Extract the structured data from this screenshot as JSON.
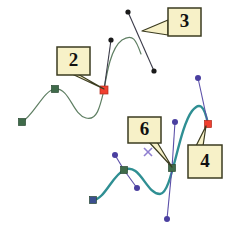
{
  "figure": {
    "background_color": "#ffffff",
    "width": 239,
    "height": 234
  },
  "colors": {
    "curve_green": "#5f7f63",
    "curve_teal": "#2f8f93",
    "handle_dark": "#3a3a48",
    "handle_purple": "#5b4fa8",
    "node_green": "#3f6b4a",
    "node_red": "#f04030",
    "node_blue": "#3b4f8f",
    "node_purple": "#4a3fa0",
    "callout_fill": "#f7f1c8",
    "callout_border": "#3b3b20",
    "cursor_purple": "#8f7fd0"
  },
  "callouts": [
    {
      "id": "callout-2",
      "label": "2",
      "x": 57,
      "y": 47,
      "w": 33,
      "h": 28,
      "tail": [
        [
          76,
          73
        ],
        [
          104,
          89
        ],
        [
          72,
          74
        ]
      ]
    },
    {
      "id": "callout-3",
      "label": "3",
      "x": 168,
      "y": 8,
      "w": 33,
      "h": 28,
      "tail": [
        [
          168,
          20
        ],
        [
          142,
          31
        ],
        [
          168,
          35
        ]
      ]
    },
    {
      "id": "callout-6",
      "label": "6",
      "x": 128,
      "y": 117,
      "w": 33,
      "h": 26,
      "tail": [
        [
          148,
          141
        ],
        [
          172,
          167
        ],
        [
          157,
          142
        ]
      ]
    },
    {
      "id": "callout-4",
      "label": "4",
      "x": 188,
      "y": 145,
      "w": 34,
      "h": 33,
      "tail": [
        [
          196,
          146
        ],
        [
          206,
          126
        ],
        [
          203,
          146
        ]
      ]
    }
  ],
  "curves": [
    {
      "id": "green-curve",
      "stroke": "#5f7f63",
      "stroke_width": 1.2,
      "path": "M 22 122 C 34 115 44 90 55 89 C 70 88 72 114 86 118 C 97 121 100 107 104 90"
    },
    {
      "id": "green-curve-upper",
      "stroke": "#5f7f63",
      "stroke_width": 1.2,
      "path": "M 104 90 C 107 72 111 48 122 40 C 133 33 136 40 141 54"
    },
    {
      "id": "teal-curve",
      "stroke": "#2f8f93",
      "stroke_width": 2.4,
      "path": "M 93 200 C 104 200 112 176 124 170 C 140 162 146 194 160 194 C 172 194 178 130 192 111 C 199 102 204 104 208 124"
    }
  ],
  "handles": [
    {
      "id": "handle-green-left",
      "stroke": "#3a3a48",
      "x1": 104,
      "y1": 90,
      "x2": 111,
      "y2": 40
    },
    {
      "id": "handle-green-right",
      "stroke": "#3a3a48",
      "x1": 128,
      "y1": 12,
      "x2": 154,
      "y2": 71
    },
    {
      "id": "handle-teal-top",
      "stroke": "#5b4fa8",
      "x1": 198,
      "y1": 78,
      "x2": 208,
      "y2": 124
    },
    {
      "id": "handle-teal-upper",
      "stroke": "#5b4fa8",
      "x1": 175,
      "y1": 122,
      "x2": 172,
      "y2": 168
    },
    {
      "id": "handle-teal-lower",
      "stroke": "#5b4fa8",
      "x1": 172,
      "y1": 168,
      "x2": 167,
      "y2": 219
    },
    {
      "id": "handle-teal-node-a",
      "stroke": "#5b4fa8",
      "x1": 115,
      "y1": 155,
      "x2": 124,
      "y2": 170
    },
    {
      "id": "handle-teal-node-b",
      "stroke": "#5b4fa8",
      "x1": 124,
      "y1": 170,
      "x2": 137,
      "y2": 188
    }
  ],
  "nodes": [
    {
      "id": "node-green-end",
      "shape": "square",
      "fill": "#3f6b4a",
      "x": 22,
      "y": 122,
      "size": 7
    },
    {
      "id": "node-green-mid",
      "shape": "square",
      "fill": "#3f6b4a",
      "x": 55,
      "y": 89,
      "size": 7
    },
    {
      "id": "node-green-active",
      "shape": "square",
      "fill": "#f04030",
      "x": 104,
      "y": 90,
      "size": 8
    },
    {
      "id": "node-teal-start",
      "shape": "square",
      "fill": "#3b4f8f",
      "x": 93,
      "y": 200,
      "size": 7
    },
    {
      "id": "node-teal-mid",
      "shape": "square",
      "fill": "#3f6b4a",
      "x": 124,
      "y": 170,
      "size": 7
    },
    {
      "id": "node-teal-sel",
      "shape": "square",
      "fill": "#3f6b4a",
      "x": 172,
      "y": 168,
      "size": 7
    },
    {
      "id": "node-teal-end",
      "shape": "square",
      "fill": "#f04030",
      "x": 208,
      "y": 124,
      "size": 7
    }
  ],
  "control_points": [
    {
      "id": "cp-green-upper-left",
      "fill": "#1a1a1a",
      "x": 111,
      "y": 40,
      "r": 2.6
    },
    {
      "id": "cp-green-upper-right",
      "fill": "#1a1a1a",
      "x": 128,
      "y": 12,
      "r": 2.6
    },
    {
      "id": "cp-green-lower-right",
      "fill": "#1a1a1a",
      "x": 154,
      "y": 71,
      "r": 2.6
    },
    {
      "id": "cp-teal-top",
      "fill": "#4a3fa0",
      "x": 198,
      "y": 78,
      "r": 3.0
    },
    {
      "id": "cp-teal-upper",
      "fill": "#4a3fa0",
      "x": 175,
      "y": 122,
      "r": 3.0
    },
    {
      "id": "cp-teal-bottom",
      "fill": "#4a3fa0",
      "x": 167,
      "y": 219,
      "r": 3.0
    },
    {
      "id": "cp-teal-node-a",
      "fill": "#4a3fa0",
      "x": 115,
      "y": 155,
      "r": 3.0
    },
    {
      "id": "cp-teal-node-b",
      "fill": "#4a3fa0",
      "x": 137,
      "y": 188,
      "r": 3.0
    }
  ],
  "cursor": {
    "id": "x-cursor",
    "label": "x",
    "x": 148,
    "y": 152,
    "arm": 4,
    "color": "#8f7fd0"
  }
}
